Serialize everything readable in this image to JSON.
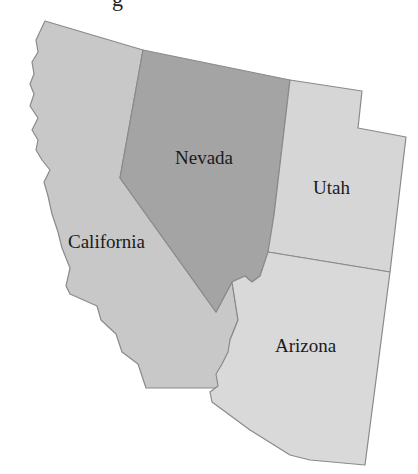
{
  "map": {
    "top_fragment": "g",
    "states": [
      {
        "id": "california",
        "label": "California",
        "fill": "#c8c8c8"
      },
      {
        "id": "nevada",
        "label": "Nevada",
        "fill": "#a4a4a4"
      },
      {
        "id": "utah",
        "label": "Utah",
        "fill": "#d6d6d6"
      },
      {
        "id": "arizona",
        "label": "Arizona",
        "fill": "#d9d9d9"
      }
    ]
  },
  "colors": {
    "background": "#ffffff",
    "border": "#8a8a8a",
    "label": "#1a1a1a"
  }
}
